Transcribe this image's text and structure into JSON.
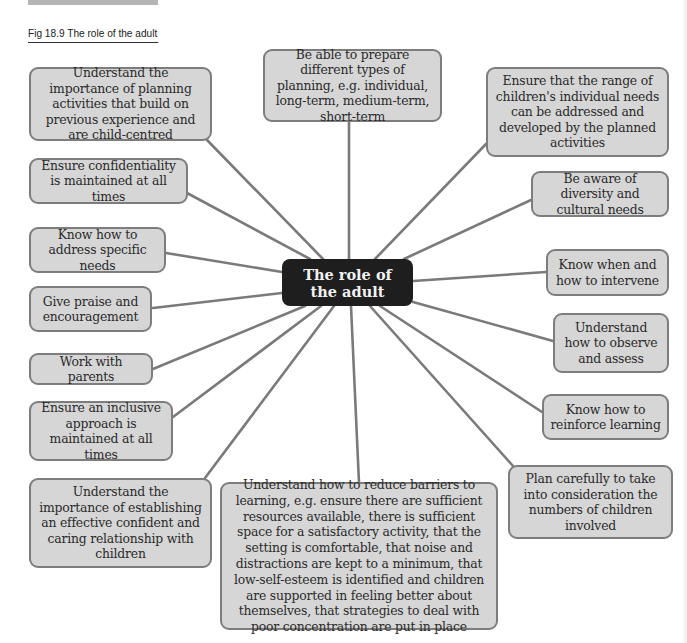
{
  "caption": "Fig 18.9  The role of the adult",
  "center": {
    "label": "The role of the adult"
  },
  "nodes": [
    {
      "id": "planning-activities",
      "text": "Understand the importance of planning activities that build on previous experience and are child-centred"
    },
    {
      "id": "types-of-planning",
      "text": "Be able to prepare different types of planning, e.g. individual, long-term, medium-term, short-term"
    },
    {
      "id": "individual-needs",
      "text": "Ensure that the range of children's individual needs can be addressed and developed by the planned activities"
    },
    {
      "id": "confidentiality",
      "text": "Ensure confidentiality is maintained at all times"
    },
    {
      "id": "diversity",
      "text": "Be aware of diversity and cultural needs"
    },
    {
      "id": "specific-needs",
      "text": "Know how to address specific needs"
    },
    {
      "id": "intervene",
      "text": "Know when and how to intervene"
    },
    {
      "id": "praise",
      "text": "Give praise and encouragement"
    },
    {
      "id": "observe-assess",
      "text": "Understand how to observe and assess"
    },
    {
      "id": "parents",
      "text": "Work with parents"
    },
    {
      "id": "reinforce-learning",
      "text": "Know how to reinforce learning"
    },
    {
      "id": "inclusive-approach",
      "text": "Ensure an inclusive approach is maintained at all times"
    },
    {
      "id": "relationship",
      "text": "Understand the importance of establishing an effective confident and caring relationship with children"
    },
    {
      "id": "barriers",
      "text": "Understand how to reduce barriers to learning, e.g. ensure there are sufficient resources available, there is sufficient space for a satisfactory activity, that the setting is comfortable, that noise and distractions are kept to a minimum, that low-self-esteem is identified and children are supported in feeling better about themselves, that strategies to deal with poor concentration are put in place"
    },
    {
      "id": "numbers-of-children",
      "text": "Plan carefully to take into consideration the numbers of children involved"
    }
  ],
  "colors": {
    "node_fill": "#d6d6d6",
    "node_border": "#7d7d7d",
    "center_fill": "#1e1e1e",
    "center_text": "#f2f2f2",
    "link": "#7a7a7a"
  }
}
